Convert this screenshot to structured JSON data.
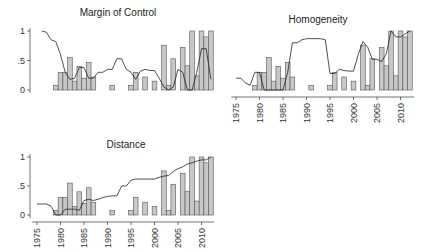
{
  "figure": {
    "panel_titles": [
      "Margin of Control",
      "Homogeneity",
      "Distance"
    ]
  },
  "chart_data": [
    {
      "type": "bar+line",
      "title": "Margin of Control",
      "xlabel": "",
      "ylabel": "",
      "ylim": [
        0,
        1
      ],
      "yticks": [
        "0",
        ".5",
        "1"
      ],
      "xticks": [],
      "bars": {
        "years": [
          1979,
          1980,
          1981,
          1982,
          1983,
          1984,
          1985,
          1986,
          1987,
          1991,
          1995,
          1996,
          1998,
          2000,
          2002,
          2003,
          2004,
          2006,
          2007,
          2008,
          2009,
          2010,
          2011,
          2012
        ],
        "values": [
          0.08,
          0.3,
          0.3,
          0.55,
          0.15,
          0.4,
          0.2,
          0.47,
          0.22,
          0.08,
          0.08,
          0.3,
          0.22,
          0.15,
          0.76,
          0.08,
          0.53,
          0.72,
          0.41,
          1.0,
          0.24,
          1.0,
          0.9,
          1.0
        ]
      },
      "line": {
        "years": [
          1976,
          1977,
          1978,
          1979,
          1980,
          1981,
          1982,
          1983,
          1984,
          1985,
          1986,
          1987,
          1988,
          1989,
          1990,
          1991,
          1992,
          1993,
          1994,
          1995,
          1996,
          1997,
          1998,
          1999,
          2000,
          2001,
          2002,
          2003,
          2004,
          2005,
          2006,
          2007,
          2008,
          2009,
          2010,
          2011,
          2012
        ],
        "values": [
          1.0,
          0.98,
          0.85,
          0.82,
          0.6,
          0.3,
          0.18,
          0.2,
          0.38,
          0.38,
          0.2,
          0.2,
          0.3,
          0.3,
          0.35,
          0.35,
          0.53,
          0.53,
          0.35,
          0.3,
          0.18,
          0.32,
          0.35,
          0.33,
          0.33,
          0.2,
          0.05,
          0.0,
          0.05,
          0.35,
          0.3,
          0.0,
          0.0,
          0.3,
          0.7,
          0.7,
          0.18
        ]
      }
    },
    {
      "type": "bar+line",
      "title": "Homogeneity",
      "xlabel": "",
      "ylabel": "",
      "ylim": [
        0,
        1
      ],
      "yticks": [],
      "xticks": [
        "1975",
        "1980",
        "1985",
        "1990",
        "1995",
        "2000",
        "2005",
        "2010"
      ],
      "bars": {
        "years": [
          1979,
          1980,
          1981,
          1982,
          1983,
          1984,
          1985,
          1986,
          1987,
          1991,
          1995,
          1996,
          1998,
          2000,
          2002,
          2003,
          2004,
          2006,
          2007,
          2008,
          2009,
          2010,
          2011,
          2012
        ],
        "values": [
          0.08,
          0.3,
          0.3,
          0.55,
          0.15,
          0.4,
          0.2,
          0.47,
          0.22,
          0.08,
          0.08,
          0.3,
          0.22,
          0.15,
          0.76,
          0.08,
          0.53,
          0.72,
          0.41,
          1.0,
          0.24,
          1.0,
          0.9,
          1.0
        ]
      },
      "line": {
        "years": [
          1975,
          1976,
          1977,
          1978,
          1979,
          1980,
          1981,
          1982,
          1983,
          1984,
          1985,
          1986,
          1987,
          1988,
          1989,
          1990,
          1991,
          1992,
          1993,
          1994,
          1995,
          1996,
          1997,
          1998,
          1999,
          2000,
          2001,
          2002,
          2003,
          2004,
          2005,
          2006,
          2007,
          2008,
          2009,
          2010,
          2011,
          2012
        ],
        "values": [
          0.2,
          0.2,
          0.12,
          0.08,
          0.3,
          0.3,
          0.0,
          0.0,
          0.0,
          0.0,
          0.0,
          0.3,
          0.8,
          0.8,
          0.85,
          0.87,
          0.87,
          0.87,
          0.87,
          0.85,
          0.28,
          0.28,
          0.35,
          0.33,
          0.32,
          0.32,
          0.6,
          0.82,
          0.73,
          0.52,
          0.52,
          0.48,
          0.62,
          1.0,
          0.9,
          0.9,
          0.95,
          1.0
        ]
      }
    },
    {
      "type": "bar+line",
      "title": "Distance",
      "xlabel": "",
      "ylabel": "",
      "ylim": [
        0,
        1
      ],
      "yticks": [
        "0",
        ".5",
        "1"
      ],
      "xticks": [
        "1975",
        "1980",
        "1985",
        "1990",
        "1995",
        "2000",
        "2005",
        "2010"
      ],
      "bars": {
        "years": [
          1979,
          1980,
          1981,
          1982,
          1983,
          1984,
          1985,
          1986,
          1987,
          1991,
          1995,
          1996,
          1998,
          2000,
          2002,
          2003,
          2004,
          2006,
          2007,
          2008,
          2009,
          2010,
          2011,
          2012
        ],
        "values": [
          0.08,
          0.3,
          0.3,
          0.55,
          0.15,
          0.4,
          0.2,
          0.47,
          0.22,
          0.08,
          0.08,
          0.3,
          0.22,
          0.15,
          0.76,
          0.08,
          0.53,
          0.72,
          0.41,
          1.0,
          0.24,
          1.0,
          0.9,
          1.0
        ]
      },
      "line": {
        "years": [
          1975,
          1976,
          1977,
          1978,
          1979,
          1980,
          1981,
          1982,
          1983,
          1984,
          1985,
          1986,
          1987,
          1988,
          1989,
          1990,
          1991,
          1992,
          1993,
          1994,
          1995,
          1996,
          1997,
          1998,
          1999,
          2000,
          2001,
          2002,
          2003,
          2004,
          2005,
          2006,
          2007,
          2008,
          2009,
          2010,
          2011,
          2012
        ],
        "values": [
          0.19,
          0.19,
          0.19,
          0.15,
          0.0,
          0.0,
          0.1,
          0.1,
          0.1,
          0.08,
          0.25,
          0.27,
          0.25,
          0.27,
          0.3,
          0.32,
          0.33,
          0.33,
          0.5,
          0.5,
          0.6,
          0.62,
          0.62,
          0.62,
          0.62,
          0.62,
          0.65,
          0.67,
          0.68,
          0.75,
          0.8,
          0.83,
          0.88,
          0.9,
          0.93,
          0.95,
          0.95,
          1.0
        ]
      }
    }
  ]
}
